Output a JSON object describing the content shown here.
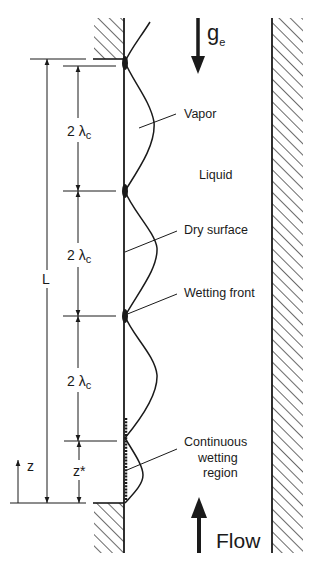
{
  "figure": {
    "type": "schematic",
    "colors": {
      "ink": "#1a1a1a",
      "background": "#ffffff"
    }
  },
  "labels": {
    "gravity": "g",
    "gravity_sub": "e",
    "vapor": "Vapor",
    "liquid": "Liquid",
    "dry_surface": "Dry surface",
    "wetting_front": "Wetting front",
    "continuous_line1": "Continuous",
    "continuous_line2": "wetting",
    "continuous_line3": "region",
    "flow": "Flow",
    "length": "L",
    "wavelength_num": "2",
    "wavelength_sym": "λ",
    "wavelength_sub": "c",
    "z": "z",
    "z_star": "z*"
  },
  "dimensions": [
    {
      "name": "2λc",
      "from_y": 66,
      "to_y": 191
    },
    {
      "name": "2λc",
      "from_y": 191,
      "to_y": 316
    },
    {
      "name": "2λc",
      "from_y": 316,
      "to_y": 441
    },
    {
      "name": "z*",
      "from_y": 441,
      "to_y": 503
    },
    {
      "name": "L",
      "from_y": 59,
      "to_y": 503
    }
  ]
}
